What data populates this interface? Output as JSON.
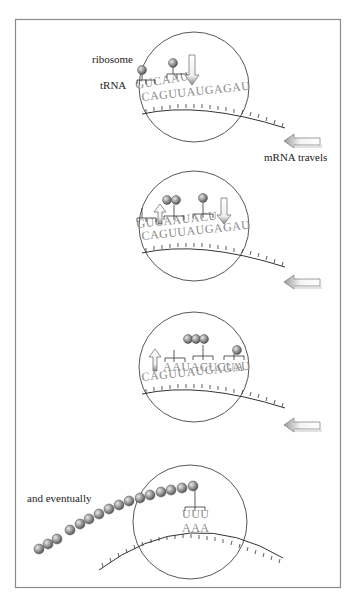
{
  "diagram": {
    "type": "translation-process",
    "labels": {
      "ribosome": "ribosome",
      "trna": "tRNA",
      "mrna_travels": "mRNA travels",
      "eventually": "and eventually"
    },
    "panels": [
      {
        "step": 1,
        "trna_anticodons": "GUCAAU",
        "mrna_sequence": "CAGUUAUGAGAU",
        "amino_acids": [
          "1",
          "2"
        ],
        "arrow": "incoming-trna"
      },
      {
        "step": 2,
        "trna_anticodons": "GUCAAUACU",
        "mrna_sequence": "CAGUUAUGAGAU",
        "amino_acids": [
          "1",
          "2",
          "3"
        ],
        "arrow": "outgoing-and-incoming-trna"
      },
      {
        "step": 3,
        "trna_anticodons": "AAUACUCUA",
        "mrna_sequence": "CAGUUAUGAGAU",
        "amino_acids": [
          "1",
          "2",
          "3",
          "4"
        ],
        "arrow": "outgoing-trna"
      },
      {
        "step": 4,
        "trna_anticodons": "UUU",
        "mrna_sequence": "AAA",
        "amino_acids_count": 18,
        "note": "and eventually"
      }
    ],
    "colors": {
      "amino_acid": "#8f8f8f",
      "sequence_text": "#8a8a8a",
      "frame": "#8a8a8a",
      "arrow_fill": "#ffffff",
      "arrow_shade": "#9a9a9a"
    }
  }
}
